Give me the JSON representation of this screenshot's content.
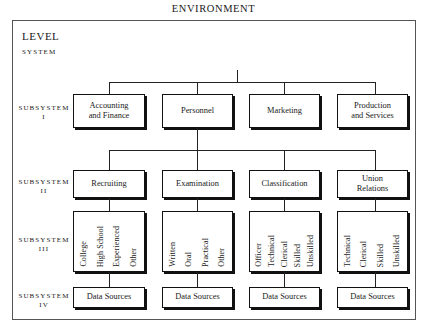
{
  "diagram": {
    "environment_label": "ENVIRONMENT",
    "levels": {
      "header": "LEVEL",
      "system": "SYSTEM",
      "subsystem_1_a": "SUBSYSTEM",
      "subsystem_1_b": "I",
      "subsystem_2_a": "SUBSYSTEM",
      "subsystem_2_b": "II",
      "subsystem_3_a": "SUBSYSTEM",
      "subsystem_3_b": "III",
      "subsystem_4_a": "SUBSYSTEM",
      "subsystem_4_b": "IV"
    },
    "system_box": {
      "line1": "INFORMATION",
      "line2": "SYSTEM"
    },
    "subsystem_1": [
      {
        "line1": "Accounting",
        "line2": "and Finance"
      },
      {
        "line1": "Personnel",
        "line2": ""
      },
      {
        "line1": "Marketing",
        "line2": ""
      },
      {
        "line1": "Production",
        "line2": "and Services"
      }
    ],
    "subsystem_2": [
      {
        "line1": "Recruiting",
        "line2": ""
      },
      {
        "line1": "Examination",
        "line2": ""
      },
      {
        "line1": "Classification",
        "line2": ""
      },
      {
        "line1": "Union",
        "line2": "Relations"
      }
    ],
    "subsystem_3": [
      {
        "items": [
          "College",
          "High School",
          "Experienced",
          "Other"
        ]
      },
      {
        "items": [
          "Written",
          "Oral",
          "Practical",
          "Other"
        ]
      },
      {
        "items": [
          "Officer",
          "Technical",
          "Clerical",
          "Skilled",
          "Unskilled"
        ]
      },
      {
        "items": [
          "Technical",
          "Clerical",
          "Skilled",
          "Unskilled"
        ]
      }
    ],
    "subsystem_4": [
      {
        "label": "Data Sources"
      },
      {
        "label": "Data Sources"
      },
      {
        "label": "Data Sources"
      },
      {
        "label": "Data Sources"
      }
    ],
    "colors": {
      "frame": "#555555",
      "box_border": "#111111",
      "connector": "#222222",
      "background": "#ffffff",
      "text": "#1a1a1a"
    }
  }
}
